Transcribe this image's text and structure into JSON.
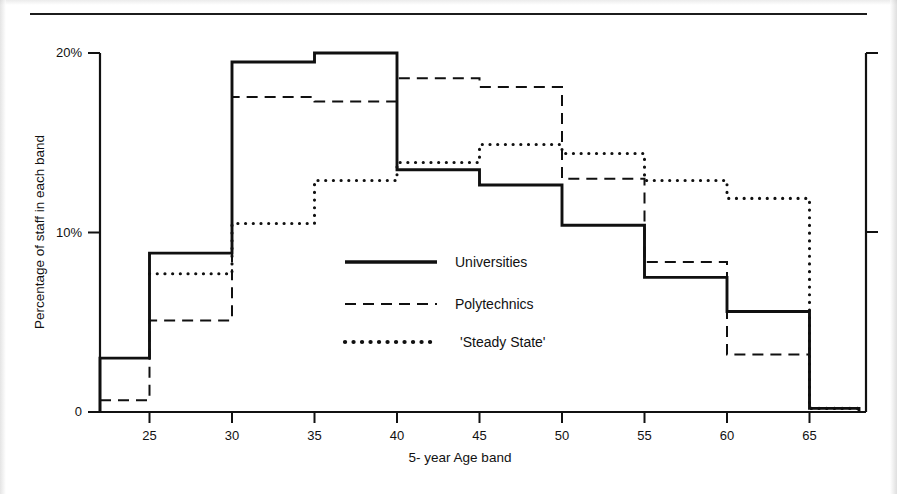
{
  "page": {
    "caption_stub": "",
    "rule": true
  },
  "chart_data": {
    "type": "line",
    "title": "",
    "xlabel": "5- year Age band",
    "ylabel": "Percentage of staff in each band",
    "ylim": [
      0,
      20
    ],
    "xlim": [
      22,
      68
    ],
    "grid": false,
    "legend_position": "center",
    "y_ticks": [
      {
        "value": 0,
        "label": "0"
      },
      {
        "value": 10,
        "label": "10%"
      },
      {
        "value": 20,
        "label": "20%"
      }
    ],
    "x_ticks": [
      {
        "value": 25,
        "label": "25"
      },
      {
        "value": 30,
        "label": "30"
      },
      {
        "value": 35,
        "label": "35"
      },
      {
        "value": 40,
        "label": "40"
      },
      {
        "value": 45,
        "label": "45"
      },
      {
        "value": 50,
        "label": "50"
      },
      {
        "value": 55,
        "label": "55"
      },
      {
        "value": 60,
        "label": "60"
      },
      {
        "value": 65,
        "label": "65"
      }
    ],
    "band_edges": [
      22,
      25,
      30,
      35,
      40,
      45,
      50,
      55,
      60,
      65,
      68
    ],
    "categories": [
      "<25",
      "25-29",
      "30-34",
      "35-39",
      "40-44",
      "45-49",
      "50-54",
      "55-59",
      "60-64",
      "65+"
    ],
    "series": [
      {
        "name": "Universities",
        "style": "solid",
        "values": [
          3.0,
          8.85,
          19.5,
          20.0,
          13.5,
          12.65,
          10.4,
          7.5,
          5.6,
          0.2
        ]
      },
      {
        "name": "Polytechnics",
        "style": "dashed",
        "values": [
          0.65,
          5.1,
          17.55,
          17.3,
          18.6,
          18.1,
          13.0,
          8.35,
          3.2,
          null
        ]
      },
      {
        "name": "'Steady State'",
        "style": "dotted",
        "values": [
          null,
          7.7,
          10.5,
          12.9,
          13.9,
          14.9,
          14.4,
          12.9,
          11.9,
          0.2
        ]
      }
    ],
    "legend": [
      {
        "label": "Universities",
        "style": "solid"
      },
      {
        "label": "Polytechnics",
        "style": "dashed"
      },
      {
        "label": "'Steady State'",
        "style": "dotted"
      }
    ]
  },
  "colors": {
    "ink": "#101010",
    "paper": "#ffffff"
  }
}
